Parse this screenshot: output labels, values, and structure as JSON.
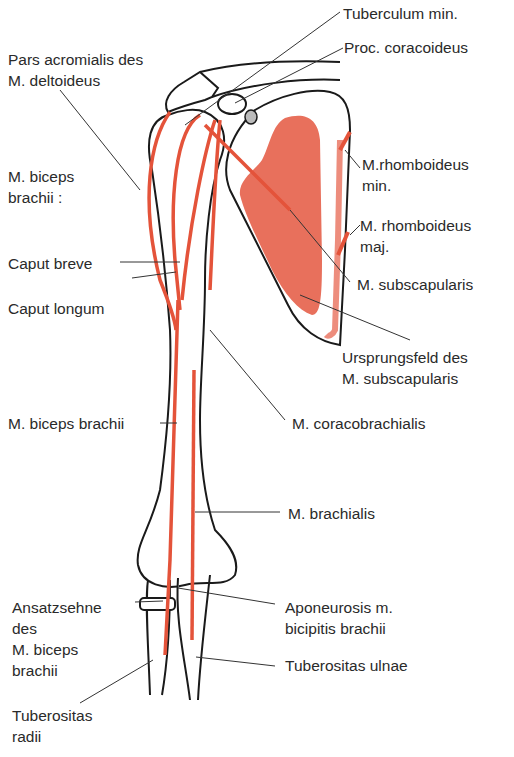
{
  "diagram": {
    "colors": {
      "muscle": "#e4533a",
      "muscle_area": "#e8705c",
      "bone_outline": "#1a1a1a",
      "leader": "#333333",
      "text": "#2a2a2a"
    },
    "labels": {
      "tuberculum_min": "Tuberculum min.",
      "proc_coracoideus": "Proc. coracoideus",
      "pars_acromialis_1": "Pars acromialis des",
      "pars_acromialis_2": "M. deltoideus",
      "rhomboideus_min_1": "M.rhomboideus",
      "rhomboideus_min_2": "min.",
      "biceps_1": "M. biceps",
      "biceps_2": "brachii :",
      "rhomboideus_maj_1": "M. rhomboideus",
      "rhomboideus_maj_2": "maj.",
      "caput_breve": "Caput breve",
      "subscapularis": "M. subscapularis",
      "caput_longum": "Caput longum",
      "ursprungsfeld_1": "Ursprungsfeld des",
      "ursprungsfeld_2": "M. subscapularis",
      "biceps_brachii": "M. biceps brachii",
      "coracobrachialis": "M. coracobrachialis",
      "brachialis": "M. brachialis",
      "ansatzsehne_1": "Ansatzsehne",
      "ansatzsehne_2": "des",
      "ansatzsehne_3": "M. biceps",
      "ansatzsehne_4": "brachii",
      "aponeurosis_1": "Aponeurosis m.",
      "aponeurosis_2": "bicipitis brachii",
      "tuberositas_ulnae": "Tuberositas ulnae",
      "tuberositas_radii_1": "Tuberositas",
      "tuberositas_radii_2": "radii"
    }
  }
}
